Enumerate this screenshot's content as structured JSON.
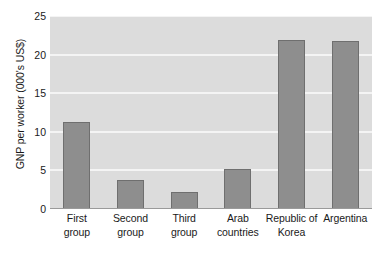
{
  "chart_data": {
    "type": "bar",
    "title": "",
    "xlabel": "",
    "ylabel": "GNP per worker (000's US$)",
    "categories": [
      "First group",
      "Second group",
      "Third group",
      "Arab countries",
      "Republic of Korea",
      "Argentina"
    ],
    "category_lines": [
      [
        "First",
        "group"
      ],
      [
        "Second",
        "group"
      ],
      [
        "Third",
        "group"
      ],
      [
        "Arab",
        "countries"
      ],
      [
        "Republic of",
        "Korea"
      ],
      [
        "Argentina"
      ]
    ],
    "values": [
      11.3,
      3.75,
      2.2,
      5.2,
      21.9,
      21.7
    ],
    "ylim": [
      0,
      25
    ],
    "yticks": [
      0,
      5,
      10,
      15,
      20,
      25
    ],
    "ytick_labels": [
      "0",
      "5",
      "10",
      "15",
      "20",
      "25"
    ],
    "grid": true,
    "grid_axis": "y",
    "legend": false,
    "legend_position": "none",
    "colors": {
      "bar_fill": "#8e8e8e",
      "bar_stroke": "#6f6f6f",
      "plot_background": "#dcdcdc",
      "gridline": "#f4f4f4",
      "axis_line": "#9a9a9a",
      "text": "#1a1a1a",
      "page_background": "#ffffff"
    }
  }
}
